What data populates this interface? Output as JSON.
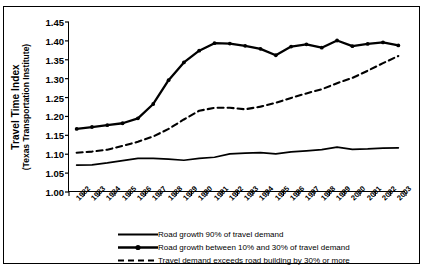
{
  "chart_data": {
    "type": "line",
    "title": "",
    "xlabel": "",
    "ylabel_line1": "Travel Time Index",
    "ylabel_line2": "(Texas Transportation Institute)",
    "ylim": [
      1.0,
      1.45
    ],
    "ytick_values": [
      "1.45",
      "1.40",
      "1.35",
      "1.30",
      "1.25",
      "1.20",
      "1.15",
      "1.10",
      "1.05",
      "1.00"
    ],
    "grid": false,
    "legend_position": "below-plot",
    "categories": [
      "1982",
      "1983",
      "1984",
      "1985",
      "1986",
      "1987",
      "1988",
      "1989",
      "1990",
      "1991",
      "1992",
      "1993",
      "1994",
      "1995",
      "1996",
      "1997",
      "1998",
      "1999",
      "2000",
      "2001",
      "2002",
      "2003"
    ],
    "series": [
      {
        "name": "Road growth 90% of travel demand",
        "style": "solid-thin",
        "markers": false,
        "values": [
          1.071,
          1.072,
          1.077,
          1.083,
          1.089,
          1.089,
          1.087,
          1.084,
          1.089,
          1.092,
          1.101,
          1.103,
          1.104,
          1.101,
          1.106,
          1.109,
          1.112,
          1.119,
          1.113,
          1.114,
          1.116,
          1.117
        ]
      },
      {
        "name": "Road growth between 10% and 30% of travel demand",
        "style": "solid-thick",
        "markers": true,
        "values": [
          1.167,
          1.172,
          1.177,
          1.182,
          1.195,
          1.233,
          1.296,
          1.343,
          1.374,
          1.394,
          1.393,
          1.387,
          1.379,
          1.362,
          1.385,
          1.391,
          1.382,
          1.401,
          1.386,
          1.392,
          1.396,
          1.388
        ]
      },
      {
        "name": "Travel demand exceeds road building by 30% or more",
        "style": "dashed",
        "markers": false,
        "values": [
          1.104,
          1.107,
          1.112,
          1.122,
          1.133,
          1.147,
          1.167,
          1.192,
          1.215,
          1.223,
          1.223,
          1.219,
          1.226,
          1.236,
          1.249,
          1.261,
          1.272,
          1.288,
          1.302,
          1.321,
          1.341,
          1.36
        ]
      }
    ]
  },
  "legend": {
    "items": [
      {
        "label": "Road growth 90% of travel demand",
        "key": "solid-thin-key"
      },
      {
        "label": "Road growth between 10% and 30% of travel demand",
        "key": "solid-thick-marker-key"
      },
      {
        "label": "Travel demand exceeds road building by 30% or more",
        "key": "dashed-key"
      }
    ]
  }
}
